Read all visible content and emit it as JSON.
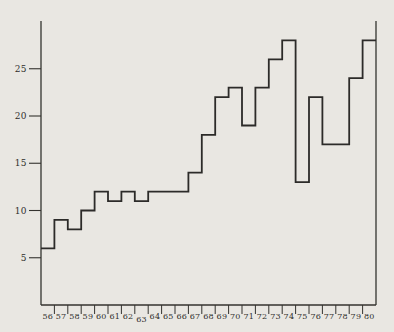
{
  "chart_data": {
    "type": "line",
    "line_style": "step-histogram",
    "title": "",
    "xlabel": "",
    "ylabel": "",
    "categories": [
      "56",
      "57",
      "58",
      "59",
      "60",
      "61",
      "62",
      "63",
      "64",
      "65",
      "66",
      "67",
      "68",
      "69",
      "70",
      "71",
      "72",
      "73",
      "74",
      "75",
      "76",
      "77",
      "78",
      "79",
      "80"
    ],
    "values": [
      6,
      9,
      8,
      10,
      12,
      11,
      12,
      11,
      12,
      12,
      12,
      14,
      18,
      22,
      23,
      19,
      23,
      26,
      28,
      13,
      22,
      17,
      17,
      24,
      28
    ],
    "ylim": [
      0,
      30
    ],
    "yticks": [
      5,
      10,
      15,
      20,
      25
    ],
    "ytick_labels": [
      "5",
      "10",
      "15",
      "20",
      "25"
    ],
    "grid": false,
    "legend": null,
    "frame": {
      "left": true,
      "bottom": true,
      "right": true,
      "top": false
    }
  },
  "style": {
    "line_color": "#2c2b29",
    "axis_color": "#34332f",
    "tick_color": "#34332f",
    "label_color": "#2f2e2b"
  }
}
